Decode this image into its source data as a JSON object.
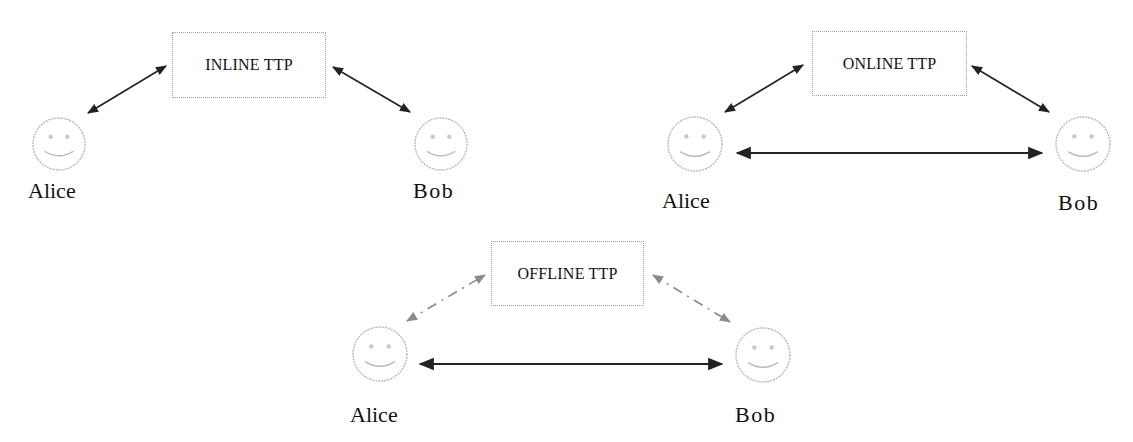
{
  "colors": {
    "arrow_solid": "#222222",
    "arrow_dashed": "#8a8a8a",
    "smiley_stroke": "#b8b8b8",
    "box_border": "#9a9a9a",
    "text": "#111111"
  },
  "panels": [
    {
      "id": "inline",
      "ttp_label": "INLINE TTP",
      "ttp_box": {
        "x": 172,
        "y": 32,
        "w": 154,
        "h": 66
      },
      "alice": {
        "label": "Alice",
        "face": {
          "cx": 59,
          "cy": 144,
          "r": 26
        },
        "label_pos": {
          "x": 28,
          "y": 180
        }
      },
      "bob": {
        "label": "Bob",
        "face": {
          "cx": 441,
          "cy": 144,
          "r": 26
        },
        "label_pos": {
          "x": 413,
          "y": 180
        }
      },
      "links": [
        {
          "from": [
            88,
            113
          ],
          "to": [
            166,
            66
          ],
          "style": "solid",
          "bidirectional": true
        },
        {
          "from": [
            333,
            67
          ],
          "to": [
            410,
            112
          ],
          "style": "solid",
          "bidirectional": true
        }
      ]
    },
    {
      "id": "online",
      "ttp_label": "ONLINE TTP",
      "ttp_box": {
        "x": 812,
        "y": 31,
        "w": 155,
        "h": 65
      },
      "alice": {
        "label": "Alice",
        "face": {
          "cx": 695,
          "cy": 144,
          "r": 27
        },
        "label_pos": {
          "x": 662,
          "y": 190
        }
      },
      "bob": {
        "label": "Bob",
        "face": {
          "cx": 1083,
          "cy": 144,
          "r": 27
        },
        "label_pos": {
          "x": 1058,
          "y": 192
        }
      },
      "links": [
        {
          "from": [
            725,
            112
          ],
          "to": [
            803,
            65
          ],
          "style": "solid",
          "bidirectional": true
        },
        {
          "from": [
            972,
            66
          ],
          "to": [
            1049,
            112
          ],
          "style": "solid",
          "bidirectional": true
        },
        {
          "from": [
            737,
            153
          ],
          "to": [
            1042,
            153
          ],
          "style": "solid",
          "bidirectional": true
        }
      ]
    },
    {
      "id": "offline",
      "ttp_label": "OFFLINE TTP",
      "ttp_box": {
        "x": 491,
        "y": 241,
        "w": 153,
        "h": 65
      },
      "alice": {
        "label": "Alice",
        "face": {
          "cx": 380,
          "cy": 354,
          "r": 27
        },
        "label_pos": {
          "x": 350,
          "y": 404
        }
      },
      "bob": {
        "label": "Bob",
        "face": {
          "cx": 763,
          "cy": 355,
          "r": 27
        },
        "label_pos": {
          "x": 735,
          "y": 404
        }
      },
      "links": [
        {
          "from": [
            407,
            321
          ],
          "to": [
            485,
            275
          ],
          "style": "dashed",
          "bidirectional": true
        },
        {
          "from": [
            653,
            275
          ],
          "to": [
            730,
            322
          ],
          "style": "dashed",
          "bidirectional": true
        },
        {
          "from": [
            420,
            364
          ],
          "to": [
            722,
            364
          ],
          "style": "solid",
          "bidirectional": true
        }
      ]
    }
  ]
}
